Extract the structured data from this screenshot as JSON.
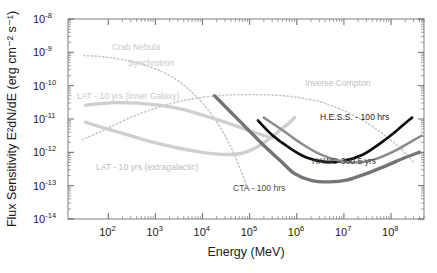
{
  "figure": {
    "background_color": "#ffffff",
    "frame_color": "#8a8a8a"
  },
  "chart_data": {
    "type": "line",
    "title": "",
    "xlabel": "Energy (MeV)",
    "ylabel": "Flux Sensitivity E²dN/dE (erg cm⁻² s⁻¹)",
    "xscale": "log",
    "yscale": "log",
    "xlim": [
      14,
      500000000
    ],
    "ylim": [
      1e-14,
      1e-08
    ],
    "grid": false,
    "legend_position": "inline-annotations",
    "xticks": [
      {
        "value": 100,
        "label": "10",
        "exponent": "2"
      },
      {
        "value": 1000,
        "label": "10",
        "exponent": "3"
      },
      {
        "value": 10000,
        "label": "10",
        "exponent": "4"
      },
      {
        "value": 100000,
        "label": "10",
        "exponent": "5"
      },
      {
        "value": 1000000,
        "label": "10",
        "exponent": "6"
      },
      {
        "value": 10000000,
        "label": "10",
        "exponent": "7"
      },
      {
        "value": 100000000,
        "label": "10",
        "exponent": "8"
      }
    ],
    "yticks": [
      {
        "value": 1e-08,
        "label": "10",
        "exponent": "-8"
      },
      {
        "value": 1e-09,
        "label": "10",
        "exponent": "-9"
      },
      {
        "value": 1e-10,
        "label": "10",
        "exponent": "-10"
      },
      {
        "value": 1e-11,
        "label": "10",
        "exponent": "-11"
      },
      {
        "value": 1e-12,
        "label": "10",
        "exponent": "-12"
      },
      {
        "value": 1e-13,
        "label": "10",
        "exponent": "-13"
      },
      {
        "value": 1e-14,
        "label": "10",
        "exponent": "-14"
      }
    ],
    "series": [
      {
        "name": "Crab Nebula Synchrotron",
        "label": "Crab Nebula",
        "label2": "Synchrotron",
        "style": "dotted",
        "color": "#c8c8c8",
        "width": 1.6,
        "points": [
          [
            30,
            8e-10
          ],
          [
            60,
            7.6e-10
          ],
          [
            120,
            6.8e-10
          ],
          [
            300,
            5.4e-10
          ],
          [
            800,
            3.6e-10
          ],
          [
            2000,
            2e-10
          ],
          [
            5000,
            8e-11
          ],
          [
            12000,
            2.2e-11
          ],
          [
            25000,
            5e-12
          ],
          [
            45000,
            1e-12
          ],
          [
            70000,
            2.2e-13
          ],
          [
            90000,
            8e-14
          ]
        ]
      },
      {
        "name": "Crab Nebula Inverse Compton",
        "label": "Inverse Compton",
        "style": "dotted",
        "color": "#c8c8c8",
        "width": 1.6,
        "points": [
          [
            28,
            2.4e-12
          ],
          [
            80,
            4.6e-12
          ],
          [
            250,
            1e-11
          ],
          [
            900,
            2e-11
          ],
          [
            4000,
            3.6e-11
          ],
          [
            20000,
            5e-11
          ],
          [
            100000,
            5.4e-11
          ],
          [
            500000,
            5e-11
          ],
          [
            2000000,
            3.8e-11
          ],
          [
            6000000,
            2.4e-11
          ],
          [
            20000000.0,
            1.1e-11
          ],
          [
            60000000.0,
            4e-12
          ],
          [
            150000000.0,
            1.4e-12
          ],
          [
            300000000.0,
            5e-13
          ]
        ]
      },
      {
        "name": "LAT - 10 yrs (inner Galaxy)",
        "label": "LAT - 10 yrs (inner Galaxy)",
        "style": "solid",
        "color": "#cfcfcf",
        "width": 3.4,
        "points": [
          [
            33,
            2.6e-11
          ],
          [
            70,
            2.9e-11
          ],
          [
            150,
            3.1e-11
          ],
          [
            400,
            3e-11
          ],
          [
            1200,
            2.6e-11
          ],
          [
            4000,
            1.9e-11
          ],
          [
            12000,
            1.2e-11
          ],
          [
            40000,
            7e-12
          ],
          [
            120000,
            4e-12
          ],
          [
            300000,
            2.7e-12
          ]
        ]
      },
      {
        "name": "LAT - 10 yrs (extragalactic)",
        "label": "LAT - 10 yrs (extragalactic)",
        "style": "solid",
        "color": "#cfcfcf",
        "width": 3.4,
        "points": [
          [
            33,
            8e-12
          ],
          [
            80,
            5.4e-12
          ],
          [
            250,
            3.4e-12
          ],
          [
            800,
            2.1e-12
          ],
          [
            3000,
            1.35e-12
          ],
          [
            10000,
            1e-12
          ],
          [
            30000,
            8.6e-13
          ],
          [
            70000,
            9.5e-13
          ],
          [
            150000,
            1.5e-12
          ],
          [
            300000,
            3e-12
          ],
          [
            600000,
            6.5e-12
          ],
          [
            900000,
            1.1e-11
          ]
        ]
      },
      {
        "name": "CTA - 100 hrs",
        "label": "CTA - 100 hrs",
        "style": "solid",
        "color": "#757575",
        "width": 3.4,
        "points": [
          [
            18000,
            5e-11
          ],
          [
            40000,
            1.6e-11
          ],
          [
            90000,
            5e-12
          ],
          [
            200000,
            1.6e-12
          ],
          [
            450000,
            5.6e-13
          ],
          [
            900000,
            2.3e-13
          ],
          [
            2000000,
            1.45e-13
          ],
          [
            5000000,
            1.3e-13
          ],
          [
            12000000.0,
            1.5e-13
          ],
          [
            30000000.0,
            2.3e-13
          ],
          [
            80000000.0,
            4e-13
          ],
          [
            200000000.0,
            7e-13
          ],
          [
            400000000.0,
            1e-12
          ]
        ]
      },
      {
        "name": "H.E.S.S. - 100 hrs",
        "label": "H.E.S.S. - 100 hrs",
        "style": "solid",
        "color": "#0d0d0d",
        "width": 2.7,
        "points": [
          [
            150000,
            9e-12
          ],
          [
            300000,
            3.3e-12
          ],
          [
            700000,
            1.35e-12
          ],
          [
            1600000,
            7e-13
          ],
          [
            4000000,
            5.2e-13
          ],
          [
            10000000.0,
            5.6e-13
          ],
          [
            25000000.0,
            8.5e-13
          ],
          [
            60000000.0,
            1.9e-12
          ],
          [
            120000000.0,
            4e-12
          ],
          [
            200000000.0,
            7.5e-12
          ],
          [
            280000000.0,
            1.1e-11
          ]
        ]
      },
      {
        "name": "HAWC-300 5 yrs",
        "label": "HAWC-300 5 yrs",
        "style": "solid",
        "color": "#8c8c8c",
        "width": 2.5,
        "points": [
          [
            200000,
            1.1e-11
          ],
          [
            500000,
            4.6e-12
          ],
          [
            1200000,
            1.9e-12
          ],
          [
            3000000,
            9e-13
          ],
          [
            8000000,
            5.6e-13
          ],
          [
            20000000.0,
            5e-13
          ],
          [
            50000000.0,
            6.5e-13
          ],
          [
            120000000.0,
            1.1e-12
          ],
          [
            250000000.0,
            2e-12
          ],
          [
            450000000.0,
            3.2e-12
          ]
        ]
      }
    ],
    "annotations": [
      {
        "text": "Crab Nebula",
        "x_px": 112,
        "y_px": 50,
        "color": "#c9c9c9",
        "size": 8.8
      },
      {
        "text": "Synchrotron",
        "x_px": 128,
        "y_px": 66,
        "color": "#c9c9c9",
        "size": 8.8
      },
      {
        "text": "Inverse Compton",
        "x_px": 305,
        "y_px": 86,
        "color": "#c0c0c0",
        "size": 8.8
      },
      {
        "text": "LAT - 10 yrs (inner Galaxy)",
        "x_px": 77,
        "y_px": 99,
        "color": "#c9c9c9",
        "size": 8.8
      },
      {
        "text": "LAT - 10 yrs (extragalactic)",
        "x_px": 96,
        "y_px": 170,
        "color": "#bdbdbd",
        "size": 8.8
      },
      {
        "text": "H.E.S.S. - 100 hrs",
        "x_px": 320,
        "y_px": 120,
        "color": "#1a1a1a",
        "size": 9.0
      },
      {
        "text": "HAWC-300 5 yrs",
        "x_px": 312,
        "y_px": 164,
        "color": "#3d3d3d",
        "size": 9.0
      },
      {
        "text": "CTA - 100 hrs",
        "x_px": 233,
        "y_px": 191,
        "color": "#4a4a4a",
        "size": 9.0
      }
    ]
  }
}
